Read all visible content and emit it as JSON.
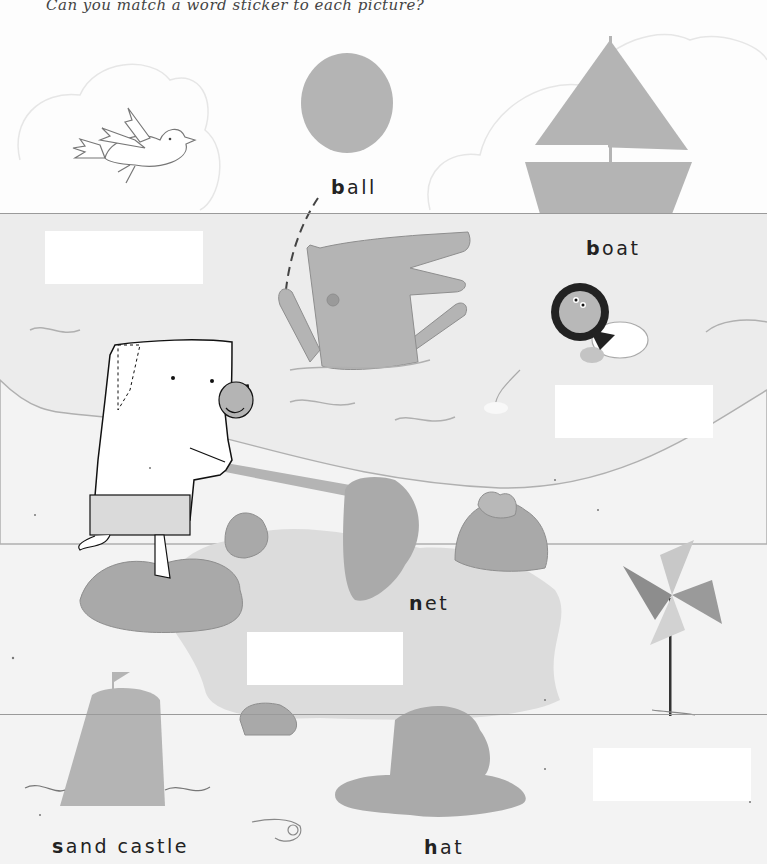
{
  "instruction": "Can you match a word sticker to each picture?",
  "words": [
    {
      "id": "ball",
      "first": "b",
      "rest": "all"
    },
    {
      "id": "boat",
      "first": "b",
      "rest": "oat"
    },
    {
      "id": "net",
      "first": "n",
      "rest": "et"
    },
    {
      "id": "sand_castle",
      "first": "s",
      "rest": "and castle"
    },
    {
      "id": "hat",
      "first": "h",
      "rest": "at"
    }
  ],
  "sticker_slots": [
    {
      "id": "slot-1",
      "x": 45,
      "y": 231,
      "w": 158,
      "h": 53
    },
    {
      "id": "slot-2",
      "x": 555,
      "y": 385,
      "w": 158,
      "h": 53
    },
    {
      "id": "slot-3",
      "x": 247,
      "y": 632,
      "w": 156,
      "h": 53
    },
    {
      "id": "slot-4",
      "x": 593,
      "y": 748,
      "w": 158,
      "h": 53
    }
  ],
  "pictures": [
    "bird",
    "ball",
    "sailboat",
    "crocodile",
    "pufferfish-sticker",
    "turtle",
    "zebra",
    "net",
    "rocks",
    "pinwheel",
    "sand-castle",
    "hat",
    "shell"
  ],
  "colors": {
    "shape_gray": "#b4b4b4",
    "sky": "#fdfdfd",
    "water": "#ececec",
    "sand": "#f3f3f3",
    "pool": "#dcdcdc",
    "rock": "#a9a9a9",
    "line": "#9a9a9a",
    "text": "#222222"
  }
}
